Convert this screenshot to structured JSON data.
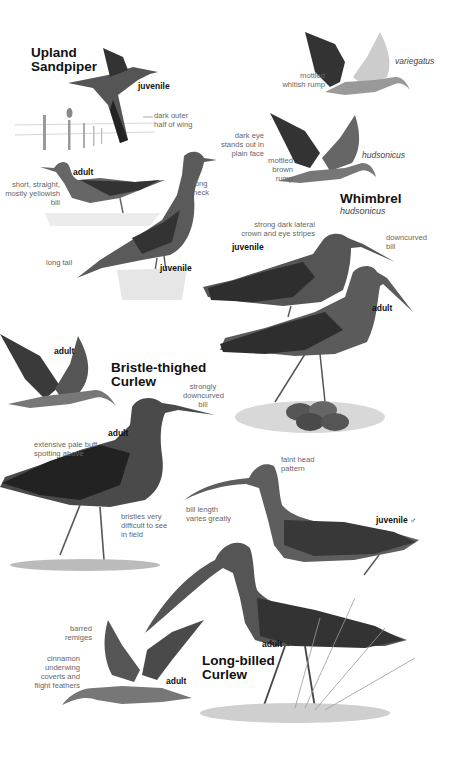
{
  "species": [
    {
      "id": "upland-sandpiper",
      "name_line1": "Upland",
      "name_line2": "Sandpiper",
      "figures": [
        {
          "age": "juvenile",
          "pose": "flight"
        },
        {
          "age": "adult",
          "pose": "standing"
        },
        {
          "age": "juvenile",
          "pose": "standing"
        }
      ],
      "notes": [
        "dark outer\nhalf of wing",
        "dark eye\nstands out in\nplain face",
        "long\nneck",
        "short, straight,\nmostly yellowish bill",
        "long tail"
      ]
    },
    {
      "id": "whimbrel",
      "name": "Whimbrel",
      "subspecies_label": "hudsonicus",
      "flight_forms": [
        {
          "subspecies": "variegatus",
          "note": "mottled\nwhitish rump"
        },
        {
          "subspecies": "hudsonicus",
          "note": "mottled\nbrown rump"
        }
      ],
      "figures": [
        {
          "age": "juvenile"
        },
        {
          "age": "adult"
        }
      ],
      "notes": [
        "strong dark lateral\ncrown and eye stripes",
        "downcurved\nbill"
      ]
    },
    {
      "id": "bristle-thighed-curlew",
      "name_line1": "Bristle-thighed",
      "name_line2": "Curlew",
      "figures": [
        {
          "age": "adult",
          "pose": "flight"
        },
        {
          "age": "adult",
          "pose": "standing"
        }
      ],
      "notes": [
        "strongly\ndowncurved\nbill",
        "extensive pale buff\nspotting above",
        "bristles very\ndifficult to see\nin field"
      ]
    },
    {
      "id": "long-billed-curlew",
      "name_line1": "Long-billed",
      "name_line2": "Curlew",
      "figures": [
        {
          "age": "juvenile ♂"
        },
        {
          "age": "adult ♀"
        },
        {
          "age": "adult",
          "pose": "flight"
        }
      ],
      "notes": [
        "faint head\npattern",
        "bill length\nvaries greatly",
        "barred\nremiges",
        "cinnamon\nunderwing\ncoverts and\nflight feathers"
      ]
    }
  ],
  "colors": {
    "background": "#ffffff",
    "title": "#111111",
    "note": "#666666",
    "bird_dark": "#2a2a2a",
    "bird_mid": "#777777",
    "bird_light": "#d8d8d8"
  }
}
